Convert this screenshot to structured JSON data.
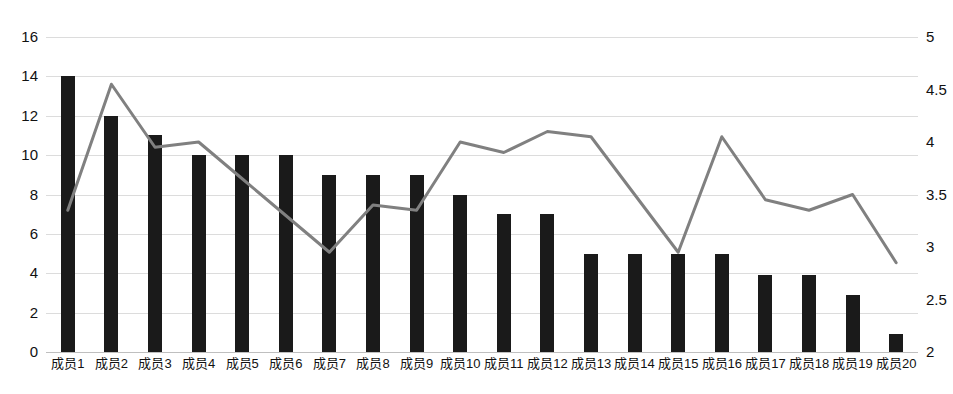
{
  "chart_data": {
    "type": "bar",
    "title": "",
    "subtitle": "",
    "xlabel": "",
    "ylabel": "",
    "y2label": "",
    "grid": true,
    "legend": "none",
    "categories": [
      "成员1",
      "成员2",
      "成员3",
      "成员4",
      "成员5",
      "成员6",
      "成员7",
      "成员8",
      "成员9",
      "成员10",
      "成员11",
      "成员12",
      "成员13",
      "成员14",
      "成员15",
      "成员16",
      "成员17",
      "成员18",
      "成员19",
      "成员20"
    ],
    "axes": {
      "left": {
        "min": 0,
        "max": 16,
        "step": 2,
        "ticks": [
          "0",
          "2",
          "4",
          "6",
          "8",
          "10",
          "12",
          "14",
          "16"
        ]
      },
      "right": {
        "min": 2,
        "max": 5,
        "step": 0.5,
        "ticks": [
          "2",
          "2.5",
          "3",
          "3.5",
          "4",
          "4.5",
          "5"
        ]
      }
    },
    "series": [
      {
        "name": "bar-series",
        "type": "bar",
        "axis": "left",
        "color": "#1a1a1a",
        "values": [
          14,
          12,
          11,
          10,
          10,
          10,
          9,
          9,
          9,
          8,
          7,
          7,
          5,
          5,
          5,
          5,
          3.9,
          3.9,
          2.9,
          0.9
        ]
      },
      {
        "name": "line-series",
        "type": "line",
        "axis": "right",
        "color": "#808080",
        "values": [
          3.35,
          4.55,
          3.95,
          4.0,
          3.65,
          3.3,
          2.95,
          3.4,
          3.35,
          4.0,
          3.9,
          4.1,
          4.05,
          3.5,
          2.95,
          4.05,
          3.45,
          3.35,
          3.5,
          2.85
        ]
      }
    ]
  },
  "colors": {
    "background": "#ffffff",
    "bar": "#1a1a1a",
    "line": "#808080",
    "gridline": "#dcdcdc",
    "axis_text": "#111111"
  }
}
